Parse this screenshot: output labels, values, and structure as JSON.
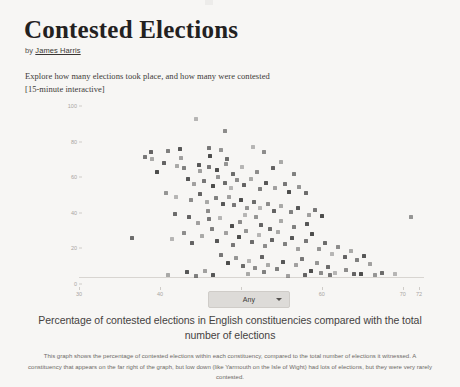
{
  "article": {
    "title": "Contested Elections",
    "byline_prefix": "by ",
    "author": "James Harris",
    "intro_line1": "Explore how many elections took place, and how many were contested",
    "intro_line2": "[15-minute interactive]"
  },
  "controls": {
    "filter_value": "Any",
    "chevron_icon": "chevron-down-icon"
  },
  "caption": "Percentage of contested elections in English constituencies compared with the total number of elections",
  "footnote": "This graph shows the percentage of contested elections within each constituency, compared to the total number of elections it witnessed. A constituency that appears on the far right of the graph, but low down (like Yarmouth on the Isle of Wight) had lots of elections, but they were very rarely contested.",
  "colors": {
    "page_background": "#f7f6f4",
    "point": "#3b3b3b",
    "axis": "#d8d5d1",
    "tick_text": "#a9a5a1",
    "dropdown_background": "#dddbd8"
  },
  "chart_data": {
    "type": "scatter",
    "title": "Percentage of contested elections in English constituencies compared with the total number of elections",
    "xlabel": "",
    "ylabel": "",
    "xlim": [
      30,
      72
    ],
    "ylim": [
      0,
      100
    ],
    "grid": false,
    "legend": null,
    "xticks": [
      30,
      40,
      50,
      60,
      70,
      72
    ],
    "yticks": [
      0,
      20,
      40,
      60,
      80,
      100
    ],
    "points": [
      {
        "x": 44.4,
        "y": 89.0
      },
      {
        "x": 48.0,
        "y": 82.0
      },
      {
        "x": 38.9,
        "y": 70.0
      },
      {
        "x": 39.0,
        "y": 66.5
      },
      {
        "x": 41.0,
        "y": 71.0
      },
      {
        "x": 42.5,
        "y": 72.0
      },
      {
        "x": 42.6,
        "y": 67.0
      },
      {
        "x": 46.0,
        "y": 72.5
      },
      {
        "x": 46.2,
        "y": 68.0
      },
      {
        "x": 47.5,
        "y": 71.5
      },
      {
        "x": 48.3,
        "y": 66.5
      },
      {
        "x": 51.5,
        "y": 73.0
      },
      {
        "x": 52.9,
        "y": 70.0
      },
      {
        "x": 40.5,
        "y": 64.0
      },
      {
        "x": 42.1,
        "y": 62.5
      },
      {
        "x": 43.0,
        "y": 61.0
      },
      {
        "x": 44.8,
        "y": 63.0
      },
      {
        "x": 45.0,
        "y": 59.5
      },
      {
        "x": 46.0,
        "y": 62.0
      },
      {
        "x": 47.0,
        "y": 60.0
      },
      {
        "x": 48.2,
        "y": 63.5
      },
      {
        "x": 49.0,
        "y": 58.0
      },
      {
        "x": 50.1,
        "y": 62.0
      },
      {
        "x": 52.0,
        "y": 59.0
      },
      {
        "x": 54.0,
        "y": 61.0
      },
      {
        "x": 55.0,
        "y": 64.5
      },
      {
        "x": 56.5,
        "y": 58.0
      },
      {
        "x": 43.5,
        "y": 55.0
      },
      {
        "x": 44.2,
        "y": 52.0
      },
      {
        "x": 45.5,
        "y": 54.0
      },
      {
        "x": 46.6,
        "y": 51.0
      },
      {
        "x": 47.2,
        "y": 56.0
      },
      {
        "x": 48.0,
        "y": 53.0
      },
      {
        "x": 48.8,
        "y": 50.0
      },
      {
        "x": 49.5,
        "y": 54.5
      },
      {
        "x": 50.4,
        "y": 51.5
      },
      {
        "x": 51.2,
        "y": 55.0
      },
      {
        "x": 52.3,
        "y": 49.5
      },
      {
        "x": 53.1,
        "y": 53.0
      },
      {
        "x": 54.2,
        "y": 50.0
      },
      {
        "x": 55.4,
        "y": 52.5
      },
      {
        "x": 56.0,
        "y": 48.0
      },
      {
        "x": 57.2,
        "y": 50.5
      },
      {
        "x": 58.0,
        "y": 47.0
      },
      {
        "x": 42.0,
        "y": 45.0
      },
      {
        "x": 43.8,
        "y": 43.0
      },
      {
        "x": 44.9,
        "y": 46.5
      },
      {
        "x": 45.8,
        "y": 42.0
      },
      {
        "x": 46.9,
        "y": 44.5
      },
      {
        "x": 47.8,
        "y": 41.0
      },
      {
        "x": 48.5,
        "y": 45.0
      },
      {
        "x": 49.2,
        "y": 40.5
      },
      {
        "x": 50.0,
        "y": 43.5
      },
      {
        "x": 50.8,
        "y": 39.0
      },
      {
        "x": 51.6,
        "y": 42.0
      },
      {
        "x": 52.4,
        "y": 38.5
      },
      {
        "x": 53.3,
        "y": 41.0
      },
      {
        "x": 54.1,
        "y": 37.0
      },
      {
        "x": 55.0,
        "y": 40.0
      },
      {
        "x": 56.2,
        "y": 36.5
      },
      {
        "x": 57.0,
        "y": 39.0
      },
      {
        "x": 58.4,
        "y": 35.0
      },
      {
        "x": 59.1,
        "y": 37.5
      },
      {
        "x": 60.0,
        "y": 34.0
      },
      {
        "x": 71.0,
        "y": 33.5
      },
      {
        "x": 36.5,
        "y": 22.0
      },
      {
        "x": 41.5,
        "y": 21.5
      },
      {
        "x": 43.0,
        "y": 25.0
      },
      {
        "x": 44.0,
        "y": 19.0
      },
      {
        "x": 45.2,
        "y": 23.0
      },
      {
        "x": 46.4,
        "y": 27.0
      },
      {
        "x": 47.0,
        "y": 20.0
      },
      {
        "x": 48.1,
        "y": 24.5
      },
      {
        "x": 49.0,
        "y": 18.0
      },
      {
        "x": 49.8,
        "y": 22.5
      },
      {
        "x": 50.6,
        "y": 26.0
      },
      {
        "x": 51.4,
        "y": 19.5
      },
      {
        "x": 52.2,
        "y": 23.5
      },
      {
        "x": 53.0,
        "y": 17.5
      },
      {
        "x": 53.8,
        "y": 21.0
      },
      {
        "x": 54.6,
        "y": 25.5
      },
      {
        "x": 55.5,
        "y": 18.5
      },
      {
        "x": 56.3,
        "y": 22.0
      },
      {
        "x": 57.1,
        "y": 16.0
      },
      {
        "x": 58.0,
        "y": 20.0
      },
      {
        "x": 58.8,
        "y": 24.0
      },
      {
        "x": 59.6,
        "y": 15.5
      },
      {
        "x": 60.4,
        "y": 19.0
      },
      {
        "x": 61.2,
        "y": 13.0
      },
      {
        "x": 62.0,
        "y": 17.0
      },
      {
        "x": 62.8,
        "y": 11.5
      },
      {
        "x": 63.6,
        "y": 14.5
      },
      {
        "x": 64.4,
        "y": 9.5
      },
      {
        "x": 65.2,
        "y": 12.0
      },
      {
        "x": 66.0,
        "y": 7.5
      },
      {
        "x": 47.6,
        "y": 12.5
      },
      {
        "x": 48.4,
        "y": 8.0
      },
      {
        "x": 49.4,
        "y": 10.5
      },
      {
        "x": 50.2,
        "y": 6.0
      },
      {
        "x": 51.0,
        "y": 9.0
      },
      {
        "x": 51.8,
        "y": 5.0
      },
      {
        "x": 52.6,
        "y": 11.0
      },
      {
        "x": 53.4,
        "y": 7.0
      },
      {
        "x": 54.4,
        "y": 4.5
      },
      {
        "x": 55.2,
        "y": 8.5
      },
      {
        "x": 56.8,
        "y": 6.5
      },
      {
        "x": 57.6,
        "y": 10.0
      },
      {
        "x": 58.6,
        "y": 3.5
      },
      {
        "x": 59.4,
        "y": 7.8
      },
      {
        "x": 60.8,
        "y": 5.5
      },
      {
        "x": 61.6,
        "y": 2.5
      },
      {
        "x": 63.0,
        "y": 4.0
      },
      {
        "x": 64.0,
        "y": 1.5
      },
      {
        "x": 41.0,
        "y": 1.0
      },
      {
        "x": 44.5,
        "y": 0.8
      },
      {
        "x": 46.5,
        "y": 1.2
      },
      {
        "x": 55.8,
        "y": 0.6
      },
      {
        "x": 61.0,
        "y": 0.9
      },
      {
        "x": 64.8,
        "y": 1.8
      },
      {
        "x": 66.6,
        "y": 1.4
      },
      {
        "x": 67.4,
        "y": 2.0
      },
      {
        "x": 69.0,
        "y": 1.6
      },
      {
        "x": 59.9,
        "y": 2.2
      },
      {
        "x": 57.9,
        "y": 1.1
      },
      {
        "x": 50.9,
        "y": 1.9
      },
      {
        "x": 52.8,
        "y": 2.8
      },
      {
        "x": 43.3,
        "y": 3.0
      },
      {
        "x": 45.6,
        "y": 3.6
      },
      {
        "x": 38.2,
        "y": 67.5
      },
      {
        "x": 39.6,
        "y": 59.0
      },
      {
        "x": 40.8,
        "y": 47.0
      },
      {
        "x": 41.8,
        "y": 35.5
      },
      {
        "x": 47.4,
        "y": 33.0
      },
      {
        "x": 49.9,
        "y": 31.0
      },
      {
        "x": 52.5,
        "y": 29.0
      },
      {
        "x": 54.9,
        "y": 31.5
      },
      {
        "x": 56.6,
        "y": 28.0
      },
      {
        "x": 58.2,
        "y": 30.0
      },
      {
        "x": 44.7,
        "y": 30.5
      },
      {
        "x": 46.1,
        "y": 32.5
      },
      {
        "x": 48.9,
        "y": 28.5
      },
      {
        "x": 51.9,
        "y": 33.5
      },
      {
        "x": 53.6,
        "y": 27.0
      },
      {
        "x": 50.5,
        "y": 35.0
      },
      {
        "x": 45.9,
        "y": 37.0
      },
      {
        "x": 43.6,
        "y": 33.8
      }
    ]
  }
}
